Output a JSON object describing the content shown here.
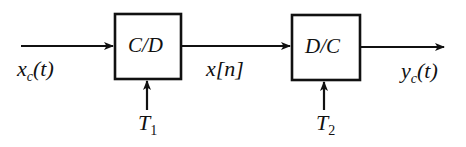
{
  "diagram": {
    "blocks": [
      {
        "id": "cd",
        "label": "C/D"
      },
      {
        "id": "dc",
        "label": "D/C"
      }
    ],
    "signals": {
      "input": {
        "base": "x",
        "sub": "c",
        "arg": "(t)"
      },
      "middle": {
        "base": "x",
        "arg": "[n]"
      },
      "output": {
        "base": "y",
        "sub": "c",
        "arg": "(t)"
      }
    },
    "controls": [
      {
        "base": "T",
        "sub": "1"
      },
      {
        "base": "T",
        "sub": "2"
      }
    ]
  }
}
